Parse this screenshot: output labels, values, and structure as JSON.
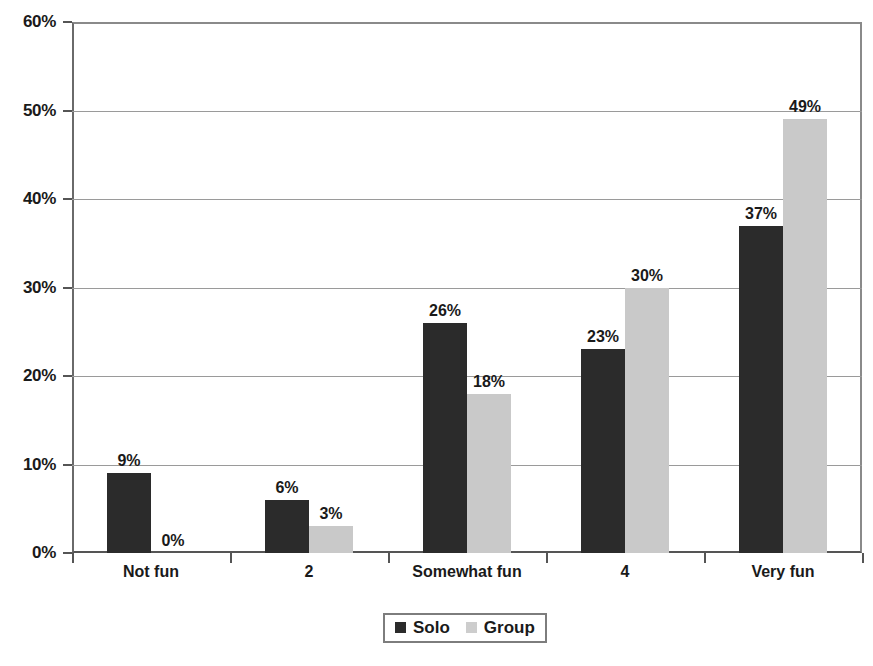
{
  "chart_data": {
    "type": "bar",
    "title": "",
    "subtitle": "",
    "xlabel": "",
    "ylabel": "",
    "categories": [
      "Not fun",
      "2",
      "Somewhat fun",
      "4",
      "Very fun"
    ],
    "series": [
      {
        "name": "Solo",
        "color": "#2b2b2b",
        "values": [
          9,
          6,
          26,
          23,
          37
        ],
        "labels": [
          "9%",
          "6%",
          "26%",
          "23%",
          "37%"
        ]
      },
      {
        "name": "Group",
        "color": "#c9c9c9",
        "values": [
          0,
          3,
          18,
          30,
          49
        ],
        "labels": [
          "0%",
          "3%",
          "18%",
          "30%",
          "49%"
        ]
      }
    ],
    "ylim": [
      0,
      60
    ],
    "yticks": [
      0,
      10,
      20,
      30,
      40,
      50,
      60
    ],
    "ytick_labels": [
      "0%",
      "10%",
      "20%",
      "30%",
      "40%",
      "50%",
      "60%"
    ],
    "grid": true,
    "legend_position": "bottom-center",
    "value_labels_shown": true
  },
  "legend": {
    "entries": [
      {
        "label": "Solo"
      },
      {
        "label": "Group"
      }
    ]
  },
  "axes": {
    "y_labels": [
      "60%",
      "50%",
      "40%",
      "30%",
      "20%",
      "10%",
      "0%"
    ],
    "x_labels": [
      "Not fun",
      "2",
      "Somewhat fun",
      "4",
      "Very fun"
    ]
  }
}
